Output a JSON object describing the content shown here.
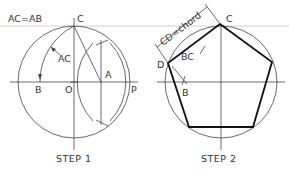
{
  "figure": {
    "colors": {
      "background": "#ffffff",
      "line": "#444444",
      "polygon": "#111111",
      "text": "#333333"
    }
  },
  "step1": {
    "caption": "STEP 1",
    "equation": "AC=AB",
    "labels": {
      "C": "C",
      "AC": "AC",
      "A": "A",
      "B": "B",
      "O": "O",
      "P": "P"
    }
  },
  "step2": {
    "caption": "STEP 2",
    "dimension": "CD=chord",
    "labels": {
      "C": "C",
      "BC": "BC",
      "D": "D",
      "B": "B"
    }
  }
}
